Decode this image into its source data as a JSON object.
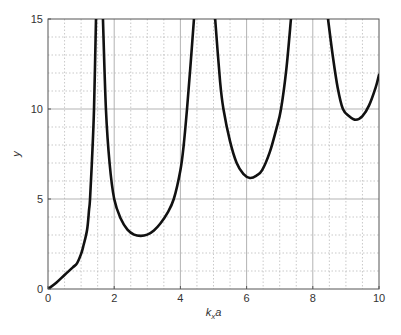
{
  "chart_data": {
    "type": "line",
    "title": "",
    "xlabel": "k_x a",
    "xlabel_parts": {
      "main": "k",
      "sub": "x",
      "tail": "a"
    },
    "ylabel": "y",
    "xlim": [
      0,
      10
    ],
    "ylim": [
      0,
      15
    ],
    "xticks": [
      0,
      2,
      4,
      6,
      8,
      10
    ],
    "yticks": [
      0,
      5,
      10,
      15
    ],
    "x_minor_step": 0.5,
    "y_minor_step": 1,
    "grid": true,
    "legend": null,
    "line_color": "#111111",
    "series": [
      {
        "name": "branch-1",
        "points": [
          [
            0,
            0
          ],
          [
            0.25,
            0.35
          ],
          [
            0.5,
            0.78
          ],
          [
            0.75,
            1.2
          ],
          [
            0.88,
            1.44
          ],
          [
            1.0,
            1.95
          ],
          [
            1.06,
            2.33
          ],
          [
            1.18,
            3.28
          ],
          [
            1.24,
            4.39
          ],
          [
            1.27,
            5
          ],
          [
            1.33,
            7.2
          ],
          [
            1.39,
            10
          ],
          [
            1.45,
            15
          ]
        ]
      },
      {
        "name": "branch-2",
        "points": [
          [
            1.66,
            15
          ],
          [
            1.75,
            10
          ],
          [
            1.86,
            7
          ],
          [
            2.0,
            5
          ],
          [
            2.2,
            3.9
          ],
          [
            2.4,
            3.3
          ],
          [
            2.6,
            3.02
          ],
          [
            2.8,
            2.95
          ],
          [
            3.0,
            3.02
          ],
          [
            3.2,
            3.25
          ],
          [
            3.4,
            3.65
          ],
          [
            3.6,
            4.2
          ],
          [
            3.8,
            5
          ],
          [
            4.0,
            6.6
          ],
          [
            4.1,
            8
          ],
          [
            4.2,
            10
          ],
          [
            4.3,
            12.3
          ],
          [
            4.41,
            15
          ]
        ]
      },
      {
        "name": "branch-3",
        "points": [
          [
            5.05,
            15
          ],
          [
            5.2,
            11.5
          ],
          [
            5.3,
            10
          ],
          [
            5.5,
            8.2
          ],
          [
            5.7,
            7.0
          ],
          [
            5.9,
            6.4
          ],
          [
            6.1,
            6.17
          ],
          [
            6.3,
            6.3
          ],
          [
            6.47,
            6.6
          ],
          [
            6.7,
            7.6
          ],
          [
            6.9,
            8.9
          ],
          [
            7.04,
            10
          ],
          [
            7.2,
            12.2
          ],
          [
            7.34,
            15
          ]
        ]
      },
      {
        "name": "branch-4",
        "points": [
          [
            8.46,
            15
          ],
          [
            8.6,
            13
          ],
          [
            8.75,
            11.2
          ],
          [
            8.91,
            10
          ],
          [
            9.1,
            9.6
          ],
          [
            9.3,
            9.4
          ],
          [
            9.5,
            9.6
          ],
          [
            9.7,
            10.2
          ],
          [
            9.9,
            11.2
          ],
          [
            10,
            11.9
          ]
        ]
      }
    ],
    "minima": [
      {
        "x": 2.8,
        "y": 2.95
      },
      {
        "x": 6.1,
        "y": 6.17
      },
      {
        "x": 9.3,
        "y": 9.4
      }
    ],
    "asymptote_crossings_at_ymax": [
      1.45,
      1.66,
      4.41,
      5.05,
      7.34,
      8.46
    ]
  },
  "layout": {
    "plot_left": 48,
    "plot_right": 379,
    "plot_top": 19,
    "plot_bottom": 289,
    "colors": {
      "major_grid": "#aaaaaa",
      "minor_grid": "#bbbbbb",
      "axis": "#555555",
      "curve": "#111111",
      "text": "#333333"
    }
  }
}
